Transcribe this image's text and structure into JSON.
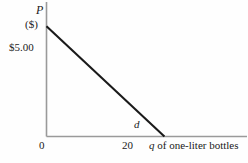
{
  "chart_data": {
    "type": "line",
    "title": "",
    "xlabel": "q of one-liter bottles",
    "ylabel": "P",
    "y_unit": "($)",
    "series": [
      {
        "name": "d",
        "label": "d",
        "x": [
          0,
          20
        ],
        "values": [
          5.0,
          0
        ]
      }
    ],
    "x_tick_labels": [
      "0",
      "20"
    ],
    "x_ticks": [
      0,
      20
    ],
    "y_tick_labels": [
      "$5.00"
    ],
    "y_ticks": [
      5.0
    ],
    "xlim": [
      0,
      34
    ],
    "ylim": [
      0,
      6.1
    ],
    "grid": false,
    "legend": "none",
    "annotations": [
      {
        "text": "d",
        "x": 21.5,
        "y": 0.55
      }
    ]
  },
  "axes": {
    "y_title": "P",
    "y_unit": "($)",
    "x_title_variable": "q",
    "x_title_rest": " of one-liter bottles",
    "origin_label": "0",
    "price_intercept_label": "$5.00",
    "quantity_tick_label": "20",
    "demand_label": "d"
  },
  "colors": {
    "background": "#fefefe",
    "axis": "#9a9a9a",
    "curve": "#1a1a1a",
    "text": "#1a1a1a"
  }
}
